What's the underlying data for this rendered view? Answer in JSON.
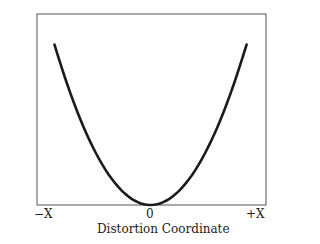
{
  "chart_data": {
    "type": "line",
    "title": "",
    "xlabel": "Distortion Coordinate",
    "ylabel": "Potential Energy",
    "x_ticks": [
      "−X",
      "0",
      "+X"
    ],
    "xlim": [
      -1,
      1
    ],
    "ylim": [
      0,
      1
    ],
    "grid": false,
    "legend": null,
    "series": [
      {
        "name": "potential",
        "shape": "parabola",
        "x": [
          -0.85,
          -0.6,
          -0.4,
          -0.2,
          0,
          0.2,
          0.4,
          0.6,
          0.85
        ],
        "y": [
          0.84,
          0.42,
          0.19,
          0.05,
          0,
          0.05,
          0.19,
          0.42,
          0.84
        ]
      }
    ],
    "line_color": "#1a1a1a",
    "frame_color": "#555555"
  }
}
